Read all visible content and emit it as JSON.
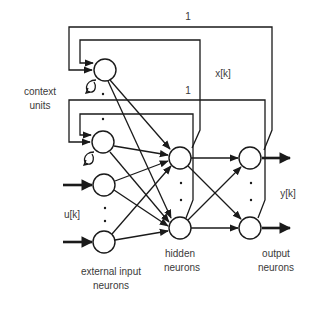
{
  "diagram": {
    "labels": {
      "context_units_line1": "context",
      "context_units_line2": "units",
      "input_signal": "u[k]",
      "state_signal": "x[k]",
      "output_signal": "y[k]",
      "feedback_weight_1": "1",
      "feedback_weight_2": "1",
      "external_input_line1": "external input",
      "external_input_line2": "neurons",
      "hidden_line1": "hidden",
      "hidden_line2": "neurons",
      "output_line1": "output",
      "output_line2": "neurons"
    },
    "layers": [
      {
        "name": "context units",
        "nodes": 2,
        "has_self_loop": true
      },
      {
        "name": "external input neurons",
        "nodes": 2
      },
      {
        "name": "hidden neurons",
        "nodes": 2
      },
      {
        "name": "output neurons",
        "nodes": 2
      }
    ],
    "connections": [
      "context units -> hidden neurons (fully connected)",
      "external input neurons -> hidden neurons (fully connected)",
      "hidden neurons -> output neurons (fully connected)",
      "hidden neurons -> context units (feedback, weight 1)",
      "output neurons -> context units (feedback, weight 1)"
    ],
    "colors": {
      "stroke": "#1a1a1a",
      "text": "#3a3a3a",
      "background": "#ffffff"
    }
  }
}
